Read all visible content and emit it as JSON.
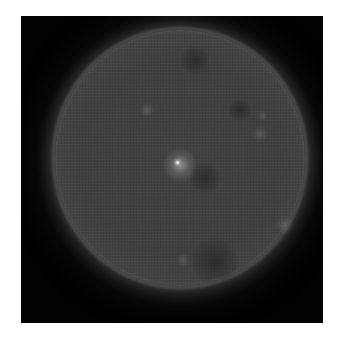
{
  "image": {
    "subject": "Solar disk (grayscale extreme-ultraviolet style view of the Sun)",
    "background_color": "#ffffff",
    "frame_color": "#020202",
    "disk_color": "#424242",
    "limb_color": "#707070"
  },
  "features": [
    {
      "name": "active-region",
      "kind": "bright",
      "x": 125,
      "y": 135,
      "size": 34
    },
    {
      "name": "plage-upper-left",
      "kind": "dim",
      "x": 92,
      "y": 80,
      "size": 14
    },
    {
      "name": "plage-upper-right",
      "kind": "dim",
      "x": 205,
      "y": 104,
      "size": 16
    },
    {
      "name": "plage-right",
      "kind": "dim",
      "x": 208,
      "y": 86,
      "size": 10
    },
    {
      "name": "plage-lower-left",
      "kind": "dim",
      "x": 128,
      "y": 230,
      "size": 12
    },
    {
      "name": "plage-lower-right",
      "kind": "dim",
      "x": 230,
      "y": 195,
      "size": 18
    },
    {
      "name": "coronal-hole-center",
      "kind": "dark",
      "x": 150,
      "y": 148,
      "size": 30
    },
    {
      "name": "coronal-hole-bottom",
      "kind": "dark",
      "x": 160,
      "y": 232,
      "size": 46
    },
    {
      "name": "coronal-hole-top",
      "kind": "dark",
      "x": 140,
      "y": 30,
      "size": 28
    },
    {
      "name": "dark-lane-upper-right",
      "kind": "dark",
      "x": 185,
      "y": 80,
      "size": 22
    }
  ]
}
